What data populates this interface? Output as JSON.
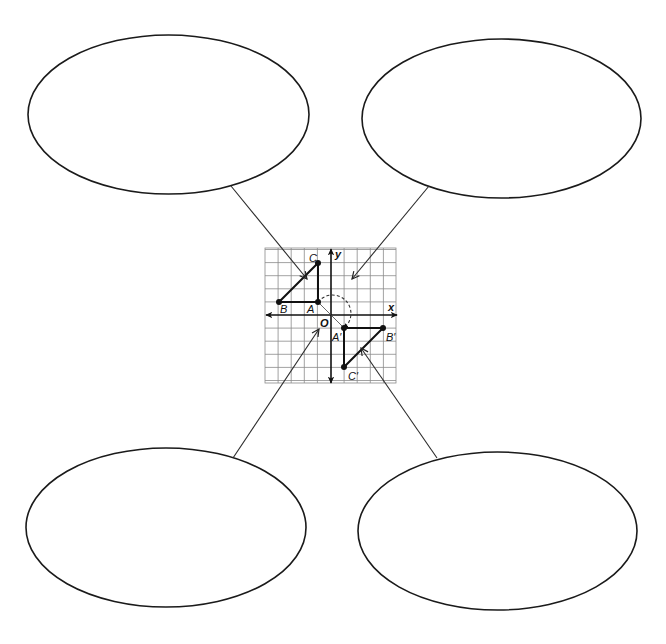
{
  "diagram": {
    "type": "concept-map-with-coordinate-graph",
    "ellipses": [
      {
        "id": "top-left",
        "cx": 168.5,
        "cy": 114.5,
        "rx": 140.5,
        "ry": 79.5,
        "text": ""
      },
      {
        "id": "top-right",
        "cx": 501.5,
        "cy": 118.5,
        "rx": 139.5,
        "ry": 79.5,
        "text": ""
      },
      {
        "id": "bottom-left",
        "cx": 166,
        "cy": 527.5,
        "rx": 140,
        "ry": 79.5,
        "text": ""
      },
      {
        "id": "bottom-right",
        "cx": 497.5,
        "cy": 531,
        "rx": 139.5,
        "ry": 79,
        "text": ""
      }
    ],
    "connectors": [
      {
        "id": "top-left",
        "from": [
          231,
          186
        ],
        "to": [
          307,
          279
        ]
      },
      {
        "id": "top-right",
        "from": [
          429,
          186
        ],
        "to": [
          352,
          279
        ]
      },
      {
        "id": "bottom-left",
        "from": [
          233,
          458
        ],
        "to": [
          319,
          329
        ]
      },
      {
        "id": "bottom-right",
        "from": [
          437,
          458
        ],
        "to": [
          361,
          348
        ]
      }
    ],
    "graph": {
      "grid": {
        "left": 265,
        "top": 248,
        "right": 396,
        "bottom": 383,
        "unit_px": 13.1
      },
      "origin_px": [
        331,
        315
      ],
      "axis_labels": {
        "x": "x",
        "y": "y",
        "origin": "O"
      },
      "preimage": {
        "name": "triangle ABC",
        "points": [
          {
            "label": "A",
            "x": -1,
            "y": 1
          },
          {
            "label": "B",
            "x": -4,
            "y": 1
          },
          {
            "label": "C",
            "x": -1,
            "y": 4
          }
        ]
      },
      "image": {
        "name": "triangle A'B'C'",
        "points": [
          {
            "label": "A′",
            "x": 1,
            "y": -1
          },
          {
            "label": "B′",
            "x": 4,
            "y": -1
          },
          {
            "label": "C′",
            "x": 1,
            "y": -4
          }
        ]
      },
      "transformation": "rotation 180° about the origin (dashed arc from A to A′)"
    }
  },
  "labels": {
    "x_axis": "x",
    "y_axis": "y",
    "origin": "O",
    "A": "A",
    "B": "B",
    "C": "C",
    "A_prime": "A′",
    "B_prime": "B′",
    "C_prime": "C′"
  },
  "colors": {
    "stroke": "#111111",
    "grid": "#8a8a8a",
    "background": "#ffffff"
  }
}
